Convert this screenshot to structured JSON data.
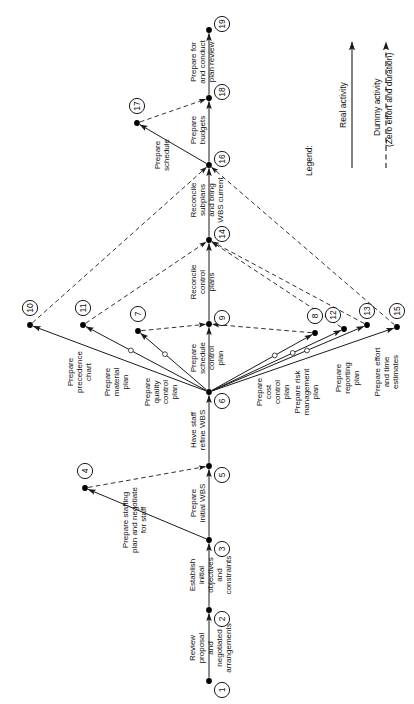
{
  "diagram": {
    "orientation": "rotated-90-ccw",
    "legend": {
      "heading": "Legend:",
      "real_activity": "Real activity",
      "dummy_activity": "Dummy activity",
      "dummy_note": "(Zero effort and duration)"
    },
    "nodes": [
      {
        "id": "1",
        "x": 209,
        "y": 681,
        "lx": 222,
        "ly": 690
      },
      {
        "id": "2",
        "x": 209,
        "y": 610,
        "lx": 222,
        "ly": 619
      },
      {
        "id": "3",
        "x": 209,
        "y": 540,
        "lx": 222,
        "ly": 549
      },
      {
        "id": "4",
        "x": 85,
        "y": 488,
        "lx": 85,
        "ly": 471
      },
      {
        "id": "5",
        "x": 209,
        "y": 466,
        "lx": 222,
        "ly": 475
      },
      {
        "id": "6",
        "x": 209,
        "y": 392,
        "lx": 222,
        "ly": 401
      },
      {
        "id": "7",
        "x": 138,
        "y": 331,
        "lx": 138,
        "ly": 314
      },
      {
        "id": "8",
        "x": 315,
        "y": 333,
        "lx": 315,
        "ly": 316
      },
      {
        "id": "9",
        "x": 209,
        "y": 324,
        "lx": 222,
        "ly": 318
      },
      {
        "id": "10",
        "x": 30,
        "y": 325,
        "lx": 30,
        "ly": 308
      },
      {
        "id": "11",
        "x": 83,
        "y": 325,
        "lx": 83,
        "ly": 308
      },
      {
        "id": "12",
        "x": 344,
        "y": 329,
        "lx": 333,
        "ly": 315
      },
      {
        "id": "13",
        "x": 367,
        "y": 325,
        "lx": 367,
        "ly": 311
      },
      {
        "id": "14",
        "x": 209,
        "y": 240,
        "lx": 222,
        "ly": 234
      },
      {
        "id": "15",
        "x": 397,
        "y": 327,
        "lx": 397,
        "ly": 311
      },
      {
        "id": "16",
        "x": 209,
        "y": 165,
        "lx": 222,
        "ly": 159
      },
      {
        "id": "17",
        "x": 137,
        "y": 123,
        "lx": 137,
        "ly": 106
      },
      {
        "id": "18",
        "x": 209,
        "y": 98,
        "lx": 222,
        "ly": 92
      },
      {
        "id": "19",
        "x": 209,
        "y": 30,
        "lx": 222,
        "ly": 24
      }
    ],
    "activities": [
      {
        "from": "1",
        "to": "2",
        "type": "real",
        "label": "Review\nproposal\nand\nnegotiated\narrangements",
        "tx": 195,
        "ty": 648,
        "anchor": "middle"
      },
      {
        "from": "2",
        "to": "3",
        "type": "real",
        "label": "Establish\ninitial\nobjectives\nand\nconstraints",
        "tx": 195,
        "ty": 575,
        "anchor": "middle"
      },
      {
        "from": "3",
        "to": "4",
        "type": "real",
        "label": "Prepare staffing\nplan and negotiate\nfor staff",
        "tx": 128,
        "ty": 520,
        "anchor": "middle"
      },
      {
        "from": "4",
        "to": "5",
        "type": "dummy",
        "label": "",
        "tx": 0,
        "ty": 0,
        "anchor": "middle"
      },
      {
        "from": "3",
        "to": "5",
        "type": "real",
        "label": "Prepare\ninitial WBS",
        "tx": 196,
        "ty": 503,
        "anchor": "middle"
      },
      {
        "from": "5",
        "to": "6",
        "type": "real",
        "label": "Have staff\nrefine WBS",
        "tx": 196,
        "ty": 430,
        "anchor": "middle"
      },
      {
        "from": "6",
        "to": "10",
        "type": "real",
        "label": "Prepare\nprecedence\nchart",
        "tx": 73,
        "ty": 372,
        "anchor": "middle"
      },
      {
        "from": "6",
        "to": "11",
        "type": "real",
        "label": "Prepare\nmaterial\nplan",
        "tx": 110,
        "ty": 382,
        "anchor": "middle"
      },
      {
        "from": "6",
        "to": "7",
        "type": "real",
        "label": "Prepare\nquality\ncontrol\nplan",
        "tx": 150,
        "ty": 392,
        "anchor": "middle"
      },
      {
        "from": "6",
        "to": "9",
        "type": "real",
        "label": "Prepare\nschedule\ncontrol\nplan",
        "tx": 196,
        "ty": 358,
        "anchor": "middle"
      },
      {
        "from": "6",
        "to": "8",
        "type": "real",
        "label": "Prepare\ncost\ncontrol\nplan",
        "tx": 262,
        "ty": 392,
        "anchor": "middle"
      },
      {
        "from": "6",
        "to": "12",
        "type": "real",
        "label": "Prepare risk\nmanagement\nplan",
        "tx": 300,
        "ty": 392,
        "anchor": "middle"
      },
      {
        "from": "6",
        "to": "13",
        "type": "real",
        "label": "Prepare\nreporting\nplan",
        "tx": 341,
        "ty": 378,
        "anchor": "middle"
      },
      {
        "from": "6",
        "to": "15",
        "type": "real",
        "label": "Prepare effort\nand time\nestimates",
        "tx": 380,
        "ty": 372,
        "anchor": "middle"
      },
      {
        "from": "7",
        "to": "9",
        "type": "dummy",
        "label": "",
        "tx": 0,
        "ty": 0,
        "anchor": "middle"
      },
      {
        "from": "8",
        "to": "9",
        "type": "dummy",
        "label": "",
        "tx": 0,
        "ty": 0,
        "anchor": "middle"
      },
      {
        "from": "9",
        "to": "14",
        "type": "real",
        "label": "Reconcile\ncontrol\nplans",
        "tx": 196,
        "ty": 282,
        "anchor": "middle"
      },
      {
        "from": "10",
        "to": "16",
        "type": "dummy",
        "label": "",
        "tx": 0,
        "ty": 0,
        "anchor": "middle"
      },
      {
        "from": "11",
        "to": "14",
        "type": "dummy",
        "label": "",
        "tx": 0,
        "ty": 0,
        "anchor": "middle"
      },
      {
        "from": "12",
        "to": "14",
        "type": "dummy",
        "label": "",
        "tx": 0,
        "ty": 0,
        "anchor": "middle"
      },
      {
        "from": "13",
        "to": "14",
        "type": "dummy",
        "label": "",
        "tx": 0,
        "ty": 0,
        "anchor": "middle"
      },
      {
        "from": "15",
        "to": "16",
        "type": "dummy",
        "label": "",
        "tx": 0,
        "ty": 0,
        "anchor": "middle"
      },
      {
        "from": "14",
        "to": "16",
        "type": "real",
        "label": "Reconcile\nsubplans\nand bring\nWBS current",
        "tx": 196,
        "ty": 200,
        "anchor": "middle"
      },
      {
        "from": "16",
        "to": "17",
        "type": "real",
        "label": "Prepare\nschedule",
        "tx": 160,
        "ty": 155,
        "anchor": "middle"
      },
      {
        "from": "16",
        "to": "18",
        "type": "real",
        "label": "Prepare\nbudgets",
        "tx": 196,
        "ty": 130,
        "anchor": "middle"
      },
      {
        "from": "17",
        "to": "18",
        "type": "dummy",
        "label": "",
        "tx": 0,
        "ty": 0,
        "anchor": "middle"
      },
      {
        "from": "18",
        "to": "19",
        "type": "real",
        "label": "Prepare for\nand conduct\nplan review",
        "tx": 196,
        "ty": 62,
        "anchor": "middle"
      }
    ],
    "colors": {
      "line": "#1a1a1a",
      "node": "#000000",
      "text": "#111111",
      "background": "#ffffff"
    }
  }
}
